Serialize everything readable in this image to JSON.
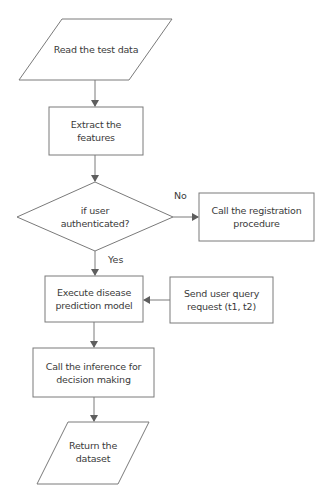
{
  "diagram": {
    "type": "flowchart",
    "stroke_color": "#6e6e6e",
    "text_color": "#3a3a3a",
    "nodes": [
      {
        "id": "read",
        "shape": "parallelogram",
        "label": "Read the test data"
      },
      {
        "id": "extract",
        "shape": "rectangle",
        "label": "Extract the features"
      },
      {
        "id": "auth",
        "shape": "diamond",
        "label_line1": "if user",
        "label_line2": "authenticated?"
      },
      {
        "id": "register",
        "shape": "rectangle",
        "label_line1": "Call the registration",
        "label_line2": "procedure"
      },
      {
        "id": "execute",
        "shape": "rectangle",
        "label_line1": "Execute disease",
        "label_line2": "prediction model"
      },
      {
        "id": "query",
        "shape": "rectangle",
        "label_line1": "Send user query",
        "label_line2": "request (t1, t2)"
      },
      {
        "id": "inference",
        "shape": "rectangle",
        "label_line1": "Call the inference for",
        "label_line2": "decision making"
      },
      {
        "id": "return",
        "shape": "parallelogram",
        "label_line1": "Return the",
        "label_line2": "dataset"
      }
    ],
    "edges": [
      {
        "from": "read",
        "to": "extract",
        "label": ""
      },
      {
        "from": "extract",
        "to": "auth",
        "label": ""
      },
      {
        "from": "auth",
        "to": "register",
        "label": "No"
      },
      {
        "from": "auth",
        "to": "execute",
        "label": "Yes"
      },
      {
        "from": "query",
        "to": "execute",
        "label": ""
      },
      {
        "from": "execute",
        "to": "inference",
        "label": ""
      },
      {
        "from": "inference",
        "to": "return",
        "label": ""
      }
    ]
  }
}
